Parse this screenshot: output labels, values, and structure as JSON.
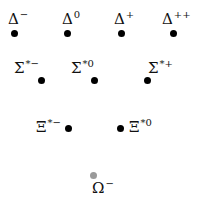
{
  "diagram": {
    "colors": {
      "dot": "#000000",
      "omega_dot": "#9a9a9a",
      "text": "#111111"
    },
    "particles": [
      {
        "symbol": "Δ",
        "charge": "−",
        "dot": [
          14,
          33
        ],
        "label": [
          8,
          12
        ]
      },
      {
        "symbol": "Δ",
        "charge": "0",
        "dot": [
          67,
          33
        ],
        "label": [
          62,
          12
        ]
      },
      {
        "symbol": "Δ",
        "charge": "+",
        "dot": [
          121,
          33
        ],
        "label": [
          114,
          12
        ]
      },
      {
        "symbol": "Δ",
        "charge": "++",
        "dot": [
          173,
          33
        ],
        "label": [
          162,
          12
        ]
      },
      {
        "symbol": "Σ",
        "charge": "*−",
        "dot": [
          41,
          80
        ],
        "label": [
          14,
          61
        ]
      },
      {
        "symbol": "Σ",
        "charge": "*0",
        "dot": [
          94,
          80
        ],
        "label": [
          71,
          61
        ]
      },
      {
        "symbol": "Σ",
        "charge": "*+",
        "dot": [
          147,
          80
        ],
        "label": [
          148,
          61
        ]
      },
      {
        "symbol": "Ξ",
        "charge": "*−",
        "dot": [
          68,
          128
        ],
        "label": [
          36,
          120
        ]
      },
      {
        "symbol": "Ξ",
        "charge": "*0",
        "dot": [
          120,
          128
        ],
        "label": [
          129,
          120
        ]
      },
      {
        "symbol": "Ω",
        "charge": "−",
        "dot": [
          93,
          175
        ],
        "label": [
          92,
          181
        ]
      }
    ]
  }
}
